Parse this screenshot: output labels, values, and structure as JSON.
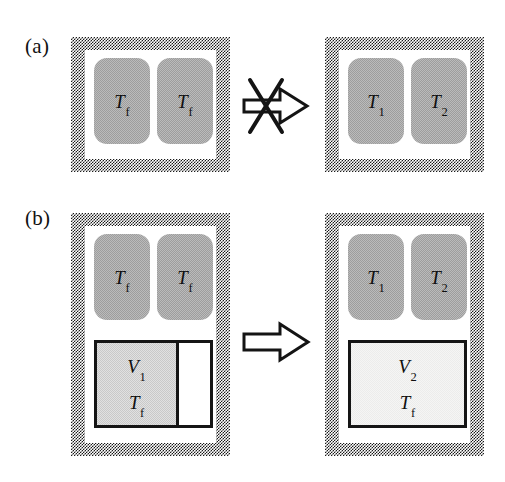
{
  "figure": {
    "width": 505,
    "height": 482,
    "background": "#ffffff"
  },
  "colors": {
    "wall_hatch": "#1a1a1a",
    "wall_background": "#ffffff",
    "reservoir_fill": "#9d9d9d",
    "gas_v1_fill": "#c9c9c9",
    "gas_v2_fill": "#ececeb",
    "outline": "#151515",
    "text": "#101010"
  },
  "panels": [
    {
      "id": "panel-a",
      "label": "(a)",
      "arrow": {
        "name": "forbidden-arrow",
        "type": "hollow-arrow-with-cross",
        "meaning": "process not allowed",
        "crossed_out": true
      },
      "before": {
        "id": "panel-a-before",
        "name": "vessel-before",
        "reservoirs": [
          {
            "name": "reservoir-left",
            "symbol": "T",
            "subscript": "f"
          },
          {
            "name": "reservoir-right",
            "symbol": "T",
            "subscript": "f"
          }
        ],
        "gas": null
      },
      "after": {
        "id": "panel-a-after",
        "name": "vessel-after",
        "reservoirs": [
          {
            "name": "reservoir-left",
            "symbol": "T",
            "subscript": "1"
          },
          {
            "name": "reservoir-right",
            "symbol": "T",
            "subscript": "2"
          }
        ],
        "gas": null
      }
    },
    {
      "id": "panel-b",
      "label": "(b)",
      "arrow": {
        "name": "process-arrow",
        "type": "hollow-arrow",
        "meaning": "process allowed",
        "crossed_out": false
      },
      "before": {
        "id": "panel-b-before",
        "name": "vessel-before",
        "reservoirs": [
          {
            "name": "reservoir-left",
            "symbol": "T",
            "subscript": "f"
          },
          {
            "name": "reservoir-right",
            "symbol": "T",
            "subscript": "f"
          }
        ],
        "gas": {
          "name": "gas-chamber-v1",
          "volume_symbol": "V",
          "volume_subscript": "1",
          "temperature_symbol": "T",
          "temperature_subscript": "f",
          "filled_fraction": 0.7,
          "has_void": true,
          "fill_shade": "medium"
        }
      },
      "after": {
        "id": "panel-b-after",
        "name": "vessel-after",
        "reservoirs": [
          {
            "name": "reservoir-left",
            "symbol": "T",
            "subscript": "1"
          },
          {
            "name": "reservoir-right",
            "symbol": "T",
            "subscript": "2"
          }
        ],
        "gas": {
          "name": "gas-chamber-v2",
          "volume_symbol": "V",
          "volume_subscript": "2",
          "temperature_symbol": "T",
          "temperature_subscript": "f",
          "filled_fraction": 1.0,
          "has_void": false,
          "fill_shade": "light"
        }
      }
    }
  ]
}
